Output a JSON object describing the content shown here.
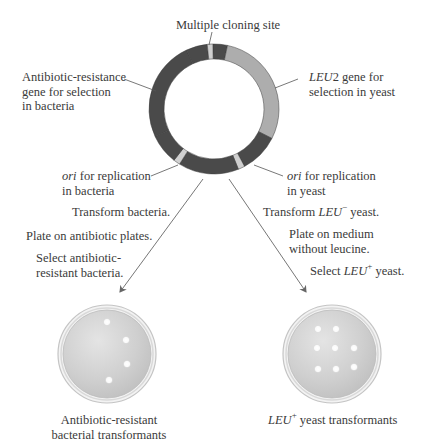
{
  "plasmid": {
    "labels": {
      "mcs": "Multiple cloning site",
      "antibiotic_gene": [
        "Antibiotic-resistance",
        "gene for selection",
        "in bacteria"
      ],
      "leu2_gene": {
        "gene": "LEU",
        "gene_suffix": "2 gene for",
        "line2": "selection in yeast"
      },
      "ori_bacteria": {
        "ital": "ori",
        "rest": " for replication",
        "line2": "in bacteria"
      },
      "ori_yeast": {
        "ital": "ori",
        "rest": " for replication",
        "line2": "in yeast"
      }
    },
    "colors": {
      "dark_segment": "#4a4a4a",
      "light_segment": "#adadad",
      "marker": "#cfcfcf"
    }
  },
  "bacteria_path": {
    "steps": [
      "Transform bacteria.",
      "Plate on antibiotic plates.",
      "Select antibiotic-",
      "resistant bacteria."
    ],
    "result": [
      "Antibiotic-resistant",
      "bacterial transformants"
    ],
    "colony_count": 4
  },
  "yeast_path": {
    "step1": {
      "pre": "Transform ",
      "gene": "LEU",
      "sup": "−",
      "post": " yeast."
    },
    "step2": [
      "Plate on medium",
      "without leucine."
    ],
    "step3": {
      "pre": "Select ",
      "gene": "LEU",
      "sup": "+",
      "post": " yeast."
    },
    "result": {
      "gene": "LEU",
      "sup": "+",
      "post": " yeast transformants"
    },
    "colony_count": 8
  }
}
